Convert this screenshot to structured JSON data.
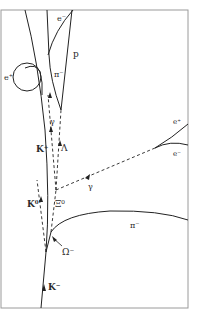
{
  "diagram": {
    "type": "bubble-chamber-track",
    "stroke_color": "#222222",
    "frame_color": "#9a9a9a",
    "labels": {
      "e_minus_top": "e⁻",
      "p": "p",
      "e_plus_left": "e⁺",
      "pi_minus_top": "π⁻",
      "gamma_upper": "γ",
      "K_plus": "K⁺",
      "Lambda": "Λ",
      "e_plus_right": "e⁺",
      "e_minus_right": "e⁻",
      "gamma_lower": "γ",
      "K0": "K⁰",
      "Xi0": "Ξ⁰",
      "pi_minus_right": "π⁻",
      "Omega_minus": "Ω⁻",
      "K_minus": "K⁻"
    }
  }
}
